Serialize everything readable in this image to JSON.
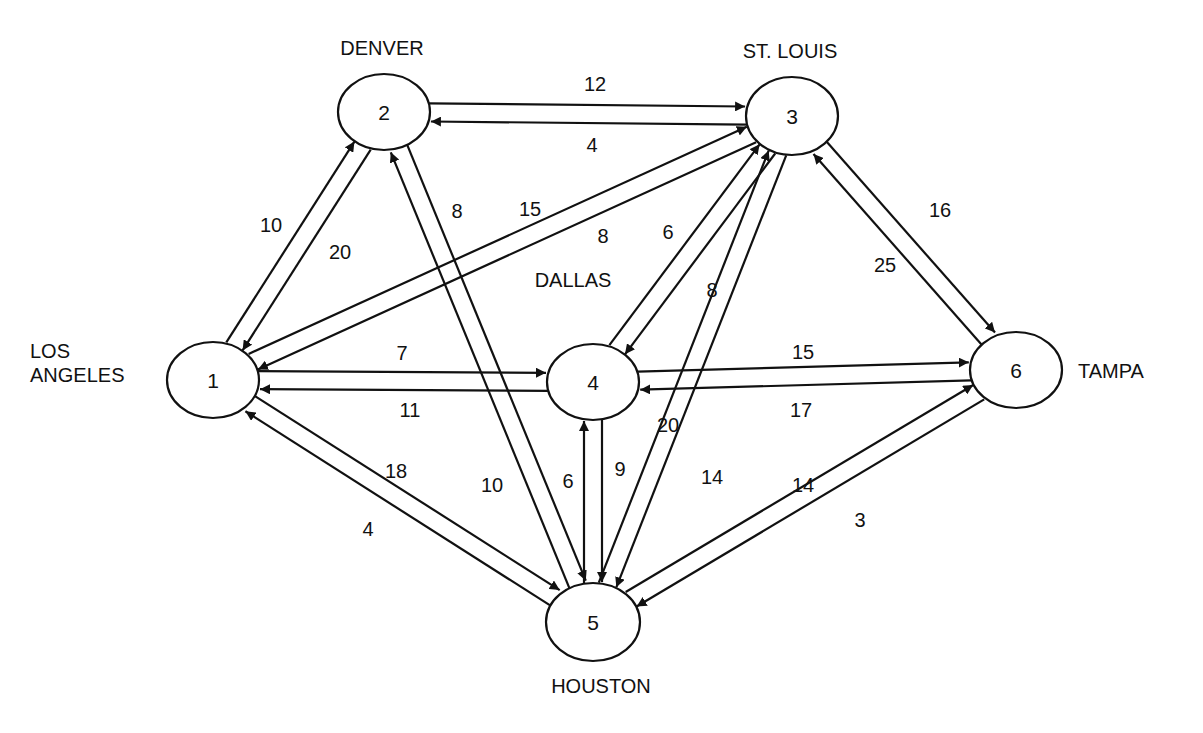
{
  "diagram": {
    "type": "directed-network",
    "nodes": [
      {
        "id": "1",
        "label": "1",
        "city": "LOS ANGELES",
        "city_lines": [
          "LOS",
          "ANGELES"
        ],
        "cx": 213,
        "cy": 380,
        "rx": 46,
        "ry": 38,
        "city_x": 30,
        "city_y": 358,
        "city_anchor": "start"
      },
      {
        "id": "2",
        "label": "2",
        "city": "DENVER",
        "city_lines": [
          "DENVER"
        ],
        "cx": 384,
        "cy": 112,
        "rx": 46,
        "ry": 38,
        "city_x": 382,
        "city_y": 55,
        "city_anchor": "middle"
      },
      {
        "id": "3",
        "label": "3",
        "city": "ST. LOUIS",
        "city_lines": [
          "ST. LOUIS"
        ],
        "cx": 792,
        "cy": 116,
        "rx": 46,
        "ry": 39,
        "city_x": 790,
        "city_y": 58,
        "city_anchor": "middle"
      },
      {
        "id": "4",
        "label": "4",
        "city": "DALLAS",
        "city_lines": [
          "DALLAS"
        ],
        "cx": 593,
        "cy": 382,
        "rx": 46,
        "ry": 38,
        "city_x": 573,
        "city_y": 287,
        "city_anchor": "middle"
      },
      {
        "id": "5",
        "label": "5",
        "city": "HOUSTON",
        "city_lines": [
          "HOUSTON"
        ],
        "cx": 593,
        "cy": 622,
        "rx": 47,
        "ry": 39,
        "city_x": 601,
        "city_y": 693,
        "city_anchor": "middle"
      },
      {
        "id": "6",
        "label": "6",
        "city": "TAMPA",
        "city_lines": [
          "TAMPA"
        ],
        "cx": 1016,
        "cy": 370,
        "rx": 46,
        "ry": 38,
        "city_x": 1078,
        "city_y": 378,
        "city_anchor": "start"
      }
    ],
    "edges": [
      {
        "from": "1",
        "to": "2",
        "weight": "10",
        "offset": -9,
        "label_x": 271,
        "label_y": 225
      },
      {
        "from": "2",
        "to": "1",
        "weight": "20",
        "offset": -9,
        "label_x": 340,
        "label_y": 252
      },
      {
        "from": "2",
        "to": "3",
        "weight": "12",
        "offset": -9,
        "label_x": 595,
        "label_y": 84
      },
      {
        "from": "3",
        "to": "2",
        "weight": "4",
        "offset": -9,
        "label_x": 592,
        "label_y": 145
      },
      {
        "from": "1",
        "to": "3",
        "weight": "15",
        "offset": -9,
        "label_x": 530,
        "label_y": 209
      },
      {
        "from": "3",
        "to": "1",
        "weight": "8",
        "offset": -9,
        "label_x": 603,
        "label_y": 236
      },
      {
        "from": "1",
        "to": "4",
        "weight": "7",
        "offset": -9,
        "label_x": 402,
        "label_y": 353
      },
      {
        "from": "4",
        "to": "1",
        "weight": "11",
        "offset": -9,
        "label_x": 410,
        "label_y": 410
      },
      {
        "from": "1",
        "to": "5",
        "weight": "18",
        "offset": -9,
        "label_x": 396,
        "label_y": 471
      },
      {
        "from": "5",
        "to": "1",
        "weight": "4",
        "offset": -9,
        "label_x": 368,
        "label_y": 529
      },
      {
        "from": "2",
        "to": "5",
        "weight": "8",
        "offset": -9,
        "label_x": 457,
        "label_y": 211
      },
      {
        "from": "5",
        "to": "2",
        "weight": "10",
        "offset": -9,
        "label_x": 492,
        "label_y": 485
      },
      {
        "from": "4",
        "to": "3",
        "weight": "6",
        "offset": -9,
        "label_x": 668,
        "label_y": 232
      },
      {
        "from": "3",
        "to": "4",
        "weight": "8",
        "offset": -9,
        "label_x": 712,
        "label_y": 290
      },
      {
        "from": "3",
        "to": "5",
        "weight": "20",
        "offset": -9,
        "label_x": 668,
        "label_y": 425
      },
      {
        "from": "5",
        "to": "3",
        "weight": "14",
        "offset": -9,
        "label_x": 712,
        "label_y": 477
      },
      {
        "from": "3",
        "to": "6",
        "weight": "16",
        "offset": -9,
        "label_x": 940,
        "label_y": 210
      },
      {
        "from": "6",
        "to": "3",
        "weight": "25",
        "offset": -9,
        "label_x": 885,
        "label_y": 265
      },
      {
        "from": "4",
        "to": "6",
        "weight": "15",
        "offset": -9,
        "label_x": 803,
        "label_y": 352
      },
      {
        "from": "6",
        "to": "4",
        "weight": "17",
        "offset": -9,
        "label_x": 801,
        "label_y": 410
      },
      {
        "from": "4",
        "to": "5",
        "weight": "9",
        "offset": -9,
        "label_x": 620,
        "label_y": 469
      },
      {
        "from": "5",
        "to": "4",
        "weight": "6",
        "offset": -9,
        "label_x": 568,
        "label_y": 481
      },
      {
        "from": "5",
        "to": "6",
        "weight": "14",
        "offset": -9,
        "label_x": 803,
        "label_y": 485
      },
      {
        "from": "6",
        "to": "5",
        "weight": "3",
        "offset": -9,
        "label_x": 860,
        "label_y": 520
      }
    ],
    "style": {
      "stroke_color": "#111111",
      "background": "#ffffff",
      "node_fill": "#ffffff"
    }
  }
}
